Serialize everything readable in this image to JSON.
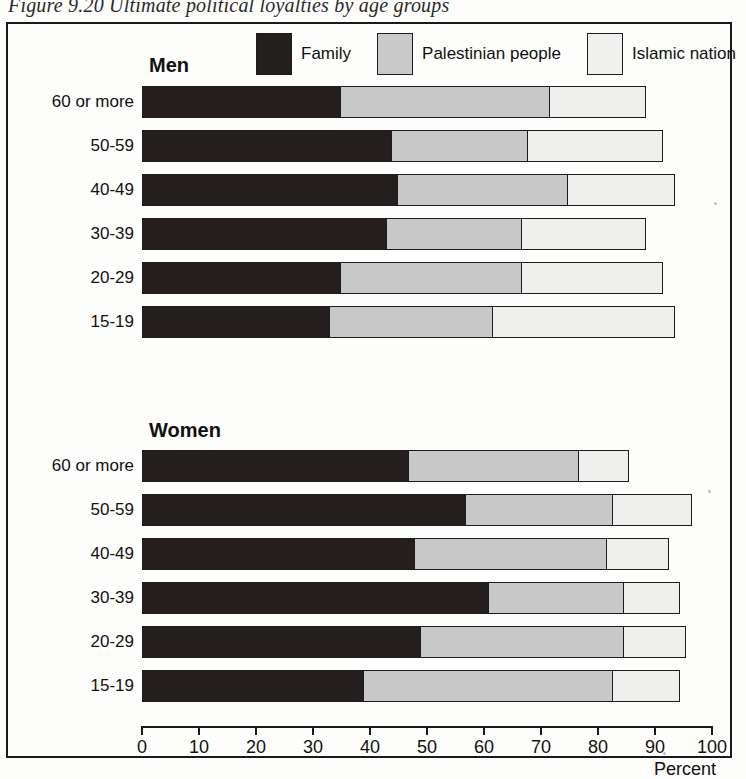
{
  "figure": {
    "caption": "Figure 9.20 Ultimate political loyalties by age groups"
  },
  "legend": {
    "items": [
      {
        "label": "Family",
        "swatch": "dark-swatch",
        "color": "#231f1e"
      },
      {
        "label": "Palestinian people",
        "swatch": "medium-gray-swatch",
        "color": "#c9c9c9"
      },
      {
        "label": "Islamic nation",
        "swatch": "light-swatch",
        "color": "#f0f0ee"
      }
    ]
  },
  "groups": [
    {
      "title": "Men"
    },
    {
      "title": "Women"
    }
  ],
  "axis": {
    "title": "Percent",
    "ticks": [
      "0",
      "10",
      "20",
      "30",
      "40",
      "50",
      "60",
      "70",
      "80",
      "90",
      "100"
    ]
  },
  "chart_data": {
    "type": "bar",
    "orientation": "horizontal",
    "stacked": true,
    "title": "Figure 9.20 Ultimate political loyalties by age groups",
    "xlabel": "Percent",
    "ylabel": "",
    "xlim": [
      0,
      100
    ],
    "xticks": [
      0,
      10,
      20,
      30,
      40,
      50,
      60,
      70,
      80,
      90,
      100
    ],
    "grid": false,
    "legend_position": "top",
    "series": [
      {
        "name": "Family",
        "color": "#231f1e"
      },
      {
        "name": "Palestinian people",
        "color": "#c9c9c9"
      },
      {
        "name": "Islamic nation",
        "color": "#f0f0ee"
      }
    ],
    "panels": [
      {
        "name": "Men",
        "categories": [
          "60 or more",
          "50-59",
          "40-49",
          "30-39",
          "20-29",
          "15-19"
        ],
        "values": {
          "Family": [
            35,
            44,
            45,
            43,
            35,
            33
          ],
          "Palestinian people": [
            37,
            24,
            30,
            24,
            32,
            29
          ],
          "Islamic nation": [
            17,
            24,
            19,
            22,
            25,
            32
          ]
        },
        "totals": [
          89,
          92,
          94,
          89,
          92,
          94
        ]
      },
      {
        "name": "Women",
        "categories": [
          "60 or more",
          "50-59",
          "40-49",
          "30-39",
          "20-29",
          "15-19"
        ],
        "values": {
          "Family": [
            47,
            57,
            48,
            61,
            49,
            39
          ],
          "Palestinian people": [
            30,
            26,
            34,
            24,
            36,
            44
          ],
          "Islamic nation": [
            9,
            14,
            11,
            10,
            11,
            12
          ]
        },
        "totals": [
          86,
          97,
          93,
          95,
          96,
          95
        ]
      }
    ]
  }
}
